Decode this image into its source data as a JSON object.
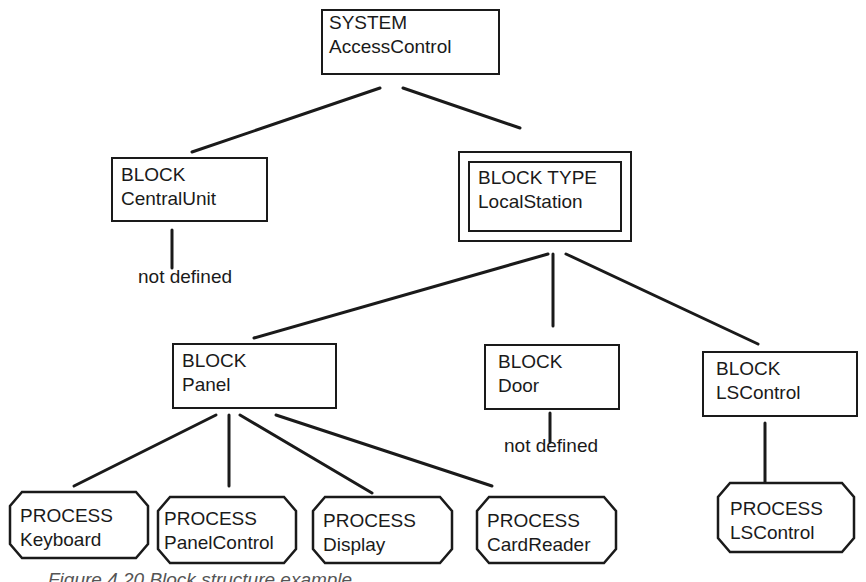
{
  "diagram": {
    "root": {
      "kind": "SYSTEM",
      "name": "AccessControl"
    },
    "level1": [
      {
        "kind": "BLOCK",
        "name": "CentralUnit",
        "child_note": "not defined"
      },
      {
        "kind": "BLOCK TYPE",
        "name": "LocalStation"
      }
    ],
    "level2": [
      {
        "kind": "BLOCK",
        "name": "Panel"
      },
      {
        "kind": "BLOCK",
        "name": "Door",
        "child_note": "not defined"
      },
      {
        "kind": "BLOCK",
        "name": "LSControl"
      }
    ],
    "processes": [
      {
        "kind": "PROCESS",
        "name": "Keyboard"
      },
      {
        "kind": "PROCESS",
        "name": "PanelControl"
      },
      {
        "kind": "PROCESS",
        "name": "Display"
      },
      {
        "kind": "PROCESS",
        "name": "CardReader"
      },
      {
        "kind": "PROCESS",
        "name": "LSControl"
      }
    ],
    "caption": "Figure 4.20   Block structure example"
  }
}
